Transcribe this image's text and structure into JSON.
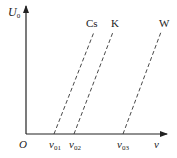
{
  "diagram": {
    "title": "",
    "y_axis_label": "U",
    "y_axis_label_sub": "0",
    "x_axis_label": "ν",
    "origin_label": "O",
    "lines": [
      {
        "name": "Cs",
        "label": "Cs",
        "intercept_label": "ν",
        "intercept_sub": "01",
        "style": "dashed"
      },
      {
        "name": "K",
        "label": "K",
        "intercept_label": "ν",
        "intercept_sub": "02",
        "style": "dashed"
      },
      {
        "name": "W",
        "label": "W",
        "intercept_label": "ν",
        "intercept_sub": "03",
        "style": "dashed"
      }
    ],
    "colors": {
      "ink": "#222222",
      "background": "#ffffff"
    }
  }
}
